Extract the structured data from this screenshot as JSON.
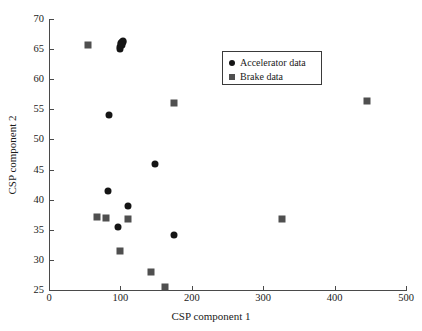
{
  "chart_data": {
    "type": "scatter",
    "title": "",
    "xlabel": "CSP component 1",
    "ylabel": "CSP component 2",
    "xlim": [
      0,
      500
    ],
    "ylim": [
      25,
      70
    ],
    "xticks": [
      0,
      100,
      200,
      300,
      400,
      500
    ],
    "yticks": [
      25,
      30,
      35,
      40,
      45,
      50,
      55,
      60,
      65,
      70
    ],
    "grid": false,
    "legend_position": "upper-center-right",
    "series": [
      {
        "name": "Accelerator data",
        "marker": "circle",
        "color": "#151515",
        "points": [
          [
            99,
            65.1
          ],
          [
            100,
            65.4
          ],
          [
            101,
            65.8
          ],
          [
            100.5,
            66.0
          ],
          [
            102,
            66.2
          ],
          [
            103,
            66.3
          ],
          [
            104,
            66.1
          ],
          [
            102.5,
            65.6
          ],
          [
            84,
            54.0
          ],
          [
            148,
            46.0
          ],
          [
            82,
            41.5
          ],
          [
            111,
            39.0
          ],
          [
            96,
            35.4
          ],
          [
            175,
            34.1
          ]
        ]
      },
      {
        "name": "Brake data",
        "marker": "square",
        "color": "#4f4f4f",
        "points": [
          [
            55,
            65.6
          ],
          [
            445,
            56.4
          ],
          [
            175,
            56.0
          ],
          [
            67,
            37.2
          ],
          [
            80,
            37.0
          ],
          [
            327,
            36.8
          ],
          [
            111,
            36.8
          ],
          [
            100,
            31.5
          ],
          [
            143,
            28.0
          ],
          [
            163,
            25.5
          ]
        ]
      }
    ]
  },
  "legend": {
    "entries": [
      {
        "label": "Accelerator data",
        "marker": "circle"
      },
      {
        "label": "Brake data",
        "marker": "square"
      }
    ]
  }
}
